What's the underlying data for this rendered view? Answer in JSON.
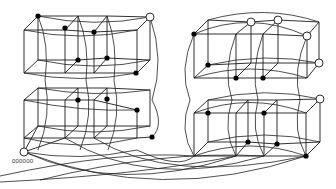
{
  "diagram": {
    "title": "",
    "type": "hypercube-graph-drawing",
    "origin_label": "000000",
    "colors": {
      "stroke": "#1a1a1a",
      "filled_vertex": "#000000",
      "hollow_vertex": "#ffffff"
    },
    "left_block": {
      "filled_vertices": [
        [
          38,
          16
        ],
        [
          65,
          28
        ],
        [
          94,
          32
        ],
        [
          78,
          60
        ],
        [
          107,
          58
        ],
        [
          136,
          73
        ],
        [
          78,
          100
        ],
        [
          107,
          99
        ],
        [
          137,
          110
        ],
        [
          152,
          137
        ]
      ],
      "hollow_vertices": [
        [
          150,
          17
        ],
        [
          24,
          152
        ]
      ]
    },
    "right_block": {
      "filled_vertices": [
        [
          194,
          34
        ],
        [
          208,
          65
        ],
        [
          236,
          78
        ],
        [
          263,
          78
        ],
        [
          208,
          113
        ],
        [
          264,
          113
        ],
        [
          248,
          142
        ],
        [
          277,
          144
        ],
        [
          306,
          156
        ]
      ],
      "hollow_vertices": [
        [
          251,
          22
        ],
        [
          278,
          20
        ],
        [
          307,
          36
        ],
        [
          319,
          63
        ],
        [
          320,
          99
        ]
      ]
    }
  }
}
